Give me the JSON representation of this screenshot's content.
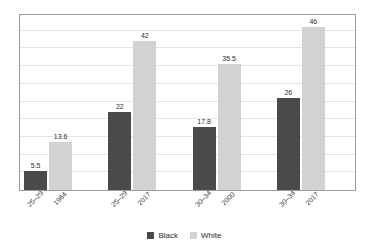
{
  "chart_data": {
    "type": "bar",
    "title": "",
    "xlabel": "",
    "ylabel": "Percentages",
    "ylim": [
      0,
      50
    ],
    "grid": true,
    "gridline_values": [
      5,
      10,
      15,
      20,
      25,
      30,
      35,
      40,
      45
    ],
    "legend_position": "bottom",
    "categories": [
      {
        "age": "25–29",
        "year": "1964"
      },
      {
        "age": "25–29",
        "year": "2017"
      },
      {
        "age": "30–34",
        "year": "2000"
      },
      {
        "age": "30–34",
        "year": "2017"
      }
    ],
    "series": [
      {
        "name": "Black",
        "color": "#4a4a4a",
        "values": [
          5.5,
          22,
          17.8,
          26
        ]
      },
      {
        "name": "White",
        "color": "#d2d2d2",
        "values": [
          13.6,
          42,
          35.5,
          46
        ]
      }
    ],
    "value_labels": {
      "g0": {
        "black": "5.5",
        "white": "13.6"
      },
      "g1": {
        "black": "22",
        "white": "42"
      },
      "g2": {
        "black": "17.8",
        "white": "35.5"
      },
      "g3": {
        "black": "26",
        "white": "46"
      }
    }
  },
  "legend": {
    "items": [
      {
        "label": "Black",
        "color": "#4a4a4a"
      },
      {
        "label": "White",
        "color": "#d2d2d2"
      }
    ]
  },
  "axis": {
    "y_title": "Percentages"
  }
}
